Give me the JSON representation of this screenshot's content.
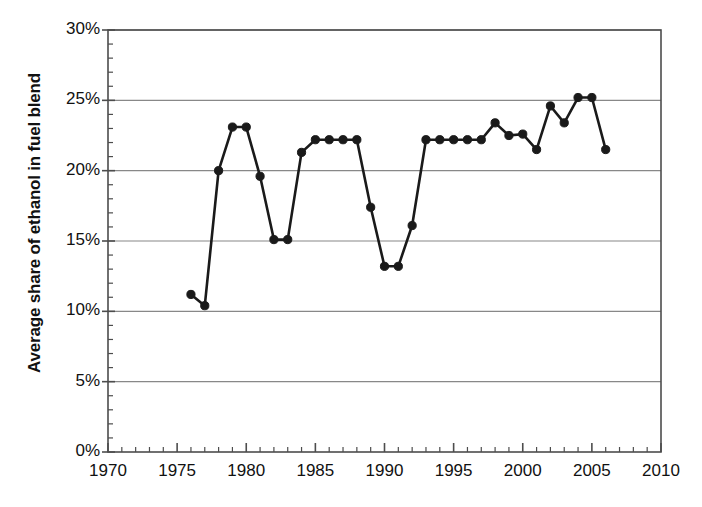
{
  "chart_data": {
    "type": "line",
    "title": "",
    "subtitle": "",
    "xlabel": "",
    "ylabel": "Average share of ethanol in fuel blend",
    "xlim": [
      1970,
      2010
    ],
    "ylim": [
      0,
      30
    ],
    "y_unit": "%",
    "grid": "horizontal",
    "legend": "none",
    "marker": "filled-circle",
    "line_color": "#1a1a1a",
    "grid_color": "#888888",
    "axis_color": "#4d4d4d",
    "x_major_tick_step": 5,
    "x_minor_tick_step": 1,
    "y_major_tick_step": 5,
    "y_minor_tick_step": 1,
    "x_tick_labels": [
      "1970",
      "1975",
      "1980",
      "1985",
      "1990",
      "1995",
      "2000",
      "2005",
      "2010"
    ],
    "x_tick_values": [
      1970,
      1975,
      1980,
      1985,
      1990,
      1995,
      2000,
      2005,
      2010
    ],
    "y_tick_labels": [
      "0%",
      "5%",
      "10%",
      "15%",
      "20%",
      "25%",
      "30%"
    ],
    "y_tick_values": [
      0,
      5,
      10,
      15,
      20,
      25,
      30
    ],
    "x": [
      1976,
      1977,
      1978,
      1979,
      1980,
      1981,
      1982,
      1983,
      1984,
      1985,
      1986,
      1987,
      1988,
      1989,
      1990,
      1991,
      1992,
      1993,
      1994,
      1995,
      1996,
      1997,
      1998,
      1999,
      2000,
      2001,
      2002,
      2003,
      2004,
      2005,
      2006
    ],
    "values": [
      11.2,
      10.4,
      20.0,
      23.1,
      23.1,
      19.6,
      15.1,
      15.1,
      21.3,
      22.2,
      22.2,
      22.2,
      22.2,
      17.4,
      13.2,
      13.2,
      16.1,
      22.2,
      22.2,
      22.2,
      22.2,
      22.2,
      23.4,
      22.5,
      22.6,
      21.5,
      24.6,
      23.4,
      25.2,
      25.2,
      21.5
    ],
    "series": [
      {
        "name": "Average share of ethanol in fuel blend",
        "values": [
          11.2,
          10.4,
          20.0,
          23.1,
          23.1,
          19.6,
          15.1,
          15.1,
          21.3,
          22.2,
          22.2,
          22.2,
          22.2,
          17.4,
          13.2,
          13.2,
          16.1,
          22.2,
          22.2,
          22.2,
          22.2,
          22.2,
          23.4,
          22.5,
          22.6,
          21.5,
          24.6,
          23.4,
          25.2,
          25.2,
          21.5
        ]
      }
    ]
  }
}
